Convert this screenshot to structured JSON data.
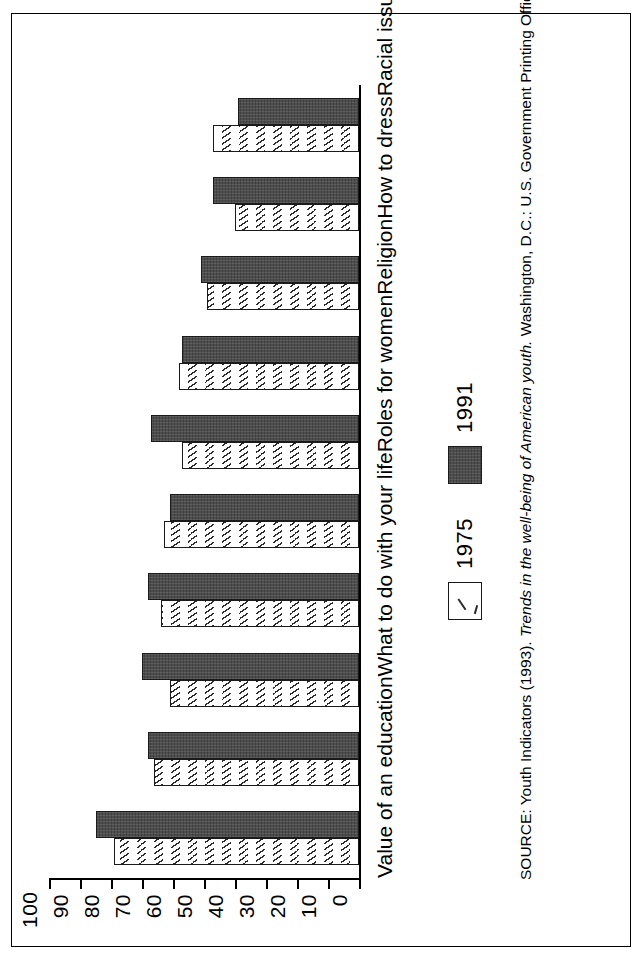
{
  "chart_data": {
    "type": "bar",
    "title": "",
    "subtitle": "",
    "xlabel": "",
    "ylabel": "",
    "ylim": [
      0,
      100
    ],
    "grid": false,
    "legend_position": "bottom",
    "orientation": "vertical-bars-printed-sideways",
    "categories": [
      "Value of an education",
      "What to do with your life",
      "Roles for women",
      "Religion",
      "How to dress",
      "Racial issues",
      "Environmental issues",
      "Politics",
      "What is permitted on a date",
      "How to spend money"
    ],
    "series": [
      {
        "name": "1975",
        "values": [
          79,
          66,
          61,
          64,
          63,
          57,
          58,
          49,
          40,
          47
        ]
      },
      {
        "name": "1991",
        "values": [
          85,
          68,
          70,
          68,
          61,
          67,
          57,
          51,
          47,
          39
        ]
      }
    ],
    "ticks": [
      0,
      10,
      20,
      30,
      40,
      50,
      60,
      70,
      80,
      90,
      100
    ],
    "tick_labels": [
      "0",
      "10",
      "20",
      "30",
      "40",
      "50",
      "60",
      "70",
      "80",
      "90",
      "100"
    ]
  },
  "legend": {
    "items": [
      {
        "label": "1975",
        "swatch": "white-hatched-swatch",
        "color": "#ffffff"
      },
      {
        "label": "1991",
        "swatch": "dark-filled-swatch",
        "color": "#4d4d4d"
      }
    ]
  },
  "source": {
    "prefix": "SOURCE: Youth Indicators (1993). ",
    "italic": "Trends in the well-being of American youth.",
    "suffix": " Washington, D.C.: U.S. Government Printing Office."
  }
}
